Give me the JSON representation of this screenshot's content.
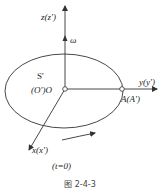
{
  "figure": {
    "caption": "图 2-4-3",
    "time_label": "(t=0)",
    "frame_label": "S'",
    "axes": {
      "z": "z(z')",
      "y": "y(y')",
      "x": "x(x')"
    },
    "angular_velocity_label": "ω",
    "origin_label": "(O')O",
    "point_label": "A(A')",
    "colors": {
      "line": "#333333",
      "background": "#ffffff"
    }
  }
}
